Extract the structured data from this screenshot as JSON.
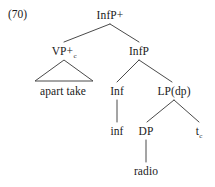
{
  "figure": {
    "example_number": "(70)",
    "type": "syntactic-tree"
  },
  "tree": {
    "root": {
      "label": "InfP+",
      "x": 110,
      "y": 10
    },
    "nodes": [
      {
        "id": "vp",
        "label": "VP+",
        "subscript": "c",
        "x": 64,
        "y": 46
      },
      {
        "id": "infp",
        "label": "InfP",
        "subscript": "",
        "x": 139,
        "y": 46
      },
      {
        "id": "apart",
        "label": "apart take",
        "subscript": "",
        "x": 63,
        "y": 86
      },
      {
        "id": "inf_cap",
        "label": "Inf",
        "subscript": "",
        "x": 117,
        "y": 86
      },
      {
        "id": "lpdp",
        "label": "LP(dp)",
        "subscript": "",
        "x": 174,
        "y": 86
      },
      {
        "id": "inf_low",
        "label": "inf",
        "subscript": "",
        "x": 117,
        "y": 126
      },
      {
        "id": "dp",
        "label": "DP",
        "subscript": "",
        "x": 146,
        "y": 126
      },
      {
        "id": "trace",
        "label": "t",
        "subscript": "c",
        "x": 199,
        "y": 126
      },
      {
        "id": "radio",
        "label": "radio",
        "subscript": "",
        "x": 146,
        "y": 166
      }
    ],
    "edges": [
      {
        "from": "InfP+",
        "to": "VP+c",
        "x1": 110,
        "y1": 24,
        "x2": 64,
        "y2": 42
      },
      {
        "from": "InfP+",
        "to": "InfP",
        "x1": 110,
        "y1": 24,
        "x2": 139,
        "y2": 42
      },
      {
        "from": "InfP",
        "to": "Inf",
        "x1": 139,
        "y1": 60,
        "x2": 117,
        "y2": 82
      },
      {
        "from": "InfP",
        "to": "LP(dp)",
        "x1": 139,
        "y1": 60,
        "x2": 172,
        "y2": 82
      },
      {
        "from": "Inf",
        "to": "inf",
        "x1": 117,
        "y1": 100,
        "x2": 117,
        "y2": 122
      },
      {
        "from": "LP(dp)",
        "to": "DP",
        "x1": 174,
        "y1": 100,
        "x2": 147,
        "y2": 122
      },
      {
        "from": "LP(dp)",
        "to": "tc",
        "x1": 174,
        "y1": 100,
        "x2": 199,
        "y2": 122
      },
      {
        "from": "DP",
        "to": "radio",
        "x1": 146,
        "y1": 140,
        "x2": 146,
        "y2": 162
      }
    ],
    "triangle": {
      "under": "VP+c",
      "apex_x": 64,
      "apex_y": 60,
      "left_x": 35,
      "right_x": 93,
      "base_y": 81
    }
  },
  "style": {
    "line_color": "#4a4a4a",
    "text_color": "#1a1a1a",
    "background": "#ffffff"
  }
}
